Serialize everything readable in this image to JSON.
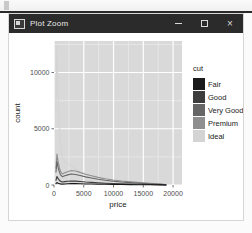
{
  "window": {
    "title": "Plot Zoom",
    "icon": "window-icon",
    "controls": {
      "minimize": "–",
      "maximize": "□",
      "close": "×"
    }
  },
  "chart_data": {
    "type": "line",
    "title": "",
    "xlabel": "price",
    "ylabel": "count",
    "xlim": [
      0,
      21500
    ],
    "ylim": [
      0,
      12800
    ],
    "xticks": [
      0,
      5000,
      10000,
      15000,
      20000
    ],
    "xtick_labels": [
      "0",
      "5000",
      "10000",
      "15000",
      "20000"
    ],
    "yticks": [
      0,
      5000,
      10000
    ],
    "ytick_labels": [
      "0",
      "5000",
      "10000"
    ],
    "grid": true,
    "panel_bg": "#d9d9d9",
    "grid_major_color": "#ffffff",
    "grid_minor_color": "#ececec",
    "legend": {
      "title": "cut",
      "position": "right",
      "entries": [
        {
          "label": "Fair",
          "color": "#1a1a1a"
        },
        {
          "label": "Good",
          "color": "#3d3d3d"
        },
        {
          "label": "Very Good",
          "color": "#666666"
        },
        {
          "label": "Premium",
          "color": "#8f8f8f"
        },
        {
          "label": "Ideal",
          "color": "#d4d4d4"
        }
      ]
    },
    "x": [
      330,
      500,
      700,
      900,
      1100,
      1400,
      1800,
      2300,
      2900,
      3600,
      4400,
      5300,
      6300,
      7400,
      8600,
      9900,
      11300,
      12800,
      14400,
      16100,
      17900,
      18800
    ],
    "series": [
      {
        "name": "Fair",
        "color": "#1a1a1a",
        "values": [
          120,
          210,
          150,
          120,
          95,
          80,
          95,
          105,
          120,
          120,
          110,
          95,
          85,
          70,
          60,
          50,
          42,
          35,
          28,
          20,
          12,
          6
        ]
      },
      {
        "name": "Good",
        "color": "#3d3d3d",
        "values": [
          420,
          760,
          560,
          420,
          330,
          270,
          300,
          330,
          360,
          345,
          310,
          265,
          230,
          190,
          160,
          130,
          105,
          85,
          65,
          45,
          26,
          12
        ]
      },
      {
        "name": "Very Good",
        "color": "#666666",
        "values": [
          1150,
          2100,
          1550,
          1180,
          900,
          740,
          820,
          900,
          980,
          940,
          850,
          720,
          620,
          510,
          420,
          340,
          270,
          215,
          160,
          110,
          62,
          28
        ]
      },
      {
        "name": "Premium",
        "color": "#8f8f8f",
        "values": [
          1500,
          2750,
          2050,
          1560,
          1200,
          980,
          1080,
          1180,
          1290,
          1240,
          1120,
          950,
          820,
          680,
          560,
          450,
          360,
          285,
          215,
          150,
          85,
          38
        ]
      },
      {
        "name": "Ideal",
        "color": "#d4d4d4",
        "values": [
          6400,
          12400,
          8200,
          5400,
          3600,
          2400,
          2150,
          1900,
          1700,
          1450,
          1200,
          980,
          800,
          640,
          510,
          400,
          310,
          240,
          180,
          120,
          66,
          28
        ]
      }
    ]
  }
}
